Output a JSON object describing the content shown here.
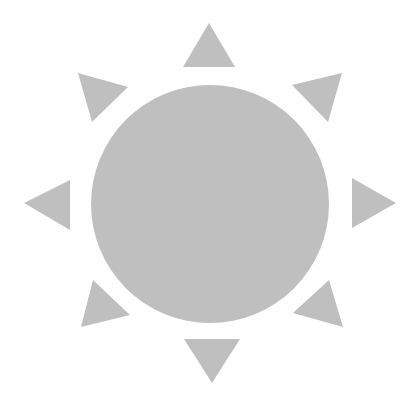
{
  "icon": {
    "name": "sun-icon",
    "fill": "#bfbfbf",
    "background": "#ffffff"
  },
  "sun": {
    "disc": {
      "cx": 210,
      "cy": 204,
      "r": 119
    },
    "rays": [
      {
        "name": "ray-top",
        "points": "209,23 235,67 183,67"
      },
      {
        "name": "ray-top-right",
        "points": "292,85 342,73 328,122"
      },
      {
        "name": "ray-right",
        "points": "352,178 396,203 352,228"
      },
      {
        "name": "ray-bottom-right",
        "points": "329,280 343,327 293,313"
      },
      {
        "name": "ray-bottom",
        "points": "184,339 240,339 212,383"
      },
      {
        "name": "ray-bottom-left",
        "points": "93,280 130,315 81,327"
      },
      {
        "name": "ray-left",
        "points": "24,203 70,180 70,230"
      },
      {
        "name": "ray-top-left",
        "points": "78,73 128,87 92,122"
      }
    ]
  }
}
